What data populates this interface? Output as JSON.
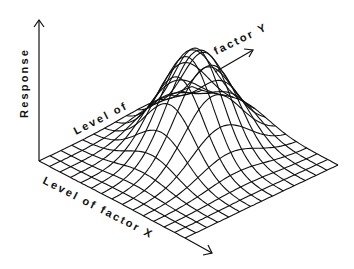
{
  "diagram": {
    "type": "3d-response-surface-wireframe",
    "axes": {
      "z_label": "Response",
      "y_label_part1": "Level of",
      "y_label_part2": "factor Y",
      "x_label": "Level of factor X"
    },
    "colors": {
      "line": "#111111",
      "background": "#ffffff"
    },
    "grid": {
      "x_lines": 14,
      "y_lines": 14
    }
  }
}
